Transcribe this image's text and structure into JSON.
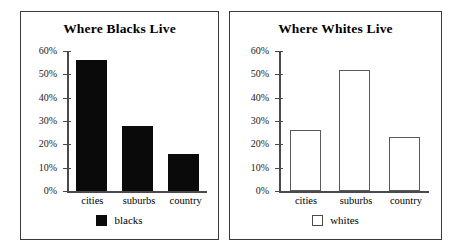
{
  "figure": {
    "panels": [
      {
        "title": "Where Blacks Live",
        "series_name": "blacks",
        "swatch_style": "filled"
      },
      {
        "title": "Where Whites Live",
        "series_name": "whites",
        "swatch_style": "hollow"
      }
    ]
  },
  "axis": {
    "ticks": [
      "60%",
      "50%",
      "40%",
      "30%",
      "20%",
      "10%",
      "0%"
    ]
  },
  "categories": [
    "cities",
    "suburbs",
    "country"
  ],
  "colors": {
    "bar_filled": "#0a0a0a",
    "bar_hollow_border": "#5a5a5a",
    "axis": "#4a4a4a",
    "frame": "#3a3a3a",
    "text": "#000000",
    "background": "#ffffff"
  },
  "chart_data": [
    {
      "type": "bar",
      "title": "Where Blacks Live",
      "categories": [
        "cities",
        "suburbs",
        "country"
      ],
      "values": [
        56,
        28,
        16
      ],
      "series": [
        {
          "name": "blacks",
          "values": [
            56,
            28,
            16
          ]
        }
      ],
      "xlabel": "",
      "ylabel": "",
      "ylim": [
        0,
        60
      ],
      "ytick_labels": [
        "0%",
        "10%",
        "20%",
        "30%",
        "40%",
        "50%",
        "60%"
      ],
      "grid": false,
      "legend_position": "bottom",
      "legend_entries": [
        "blacks"
      ],
      "value_unit": "percent"
    },
    {
      "type": "bar",
      "title": "Where Whites Live",
      "categories": [
        "cities",
        "suburbs",
        "country"
      ],
      "values": [
        26,
        52,
        23
      ],
      "series": [
        {
          "name": "whites",
          "values": [
            26,
            52,
            23
          ]
        }
      ],
      "xlabel": "",
      "ylabel": "",
      "ylim": [
        0,
        60
      ],
      "ytick_labels": [
        "0%",
        "10%",
        "20%",
        "30%",
        "40%",
        "50%",
        "60%"
      ],
      "grid": false,
      "legend_position": "bottom",
      "legend_entries": [
        "whites"
      ],
      "value_unit": "percent"
    }
  ]
}
